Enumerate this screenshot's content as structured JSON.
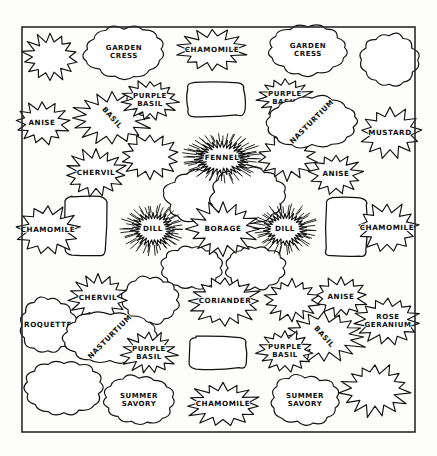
{
  "document": {
    "title": "Herb Garden Plan",
    "kind": "hand-drawn garden planting plan",
    "border": {
      "x": 22,
      "y": 27,
      "width": 393,
      "height": 405,
      "color": "#2a2a2a"
    }
  },
  "palette": {
    "ink": "#111111",
    "paper": "#fdfdfc",
    "label_text": "#0d0d0d"
  },
  "plants": [
    {
      "id": "p01",
      "label": "GARDEN CRESS",
      "lines": [
        "GARDEN",
        "CRESS"
      ],
      "x": 124,
      "y": 52,
      "rx": 38,
      "ry": 24,
      "shape": "cloud",
      "points": 13,
      "rotate": 0
    },
    {
      "id": "p02",
      "label": "CHAMOMILE",
      "lines": [
        "CHAMOMILE"
      ],
      "x": 212,
      "y": 50,
      "rx": 34,
      "ry": 21,
      "shape": "star",
      "points": 14,
      "rotate": 0
    },
    {
      "id": "p03",
      "label": "GARDEN CRESS",
      "lines": [
        "GARDEN",
        "CRESS"
      ],
      "x": 308,
      "y": 50,
      "rx": 38,
      "ry": 23,
      "shape": "cloud",
      "points": 13,
      "rotate": 0
    },
    {
      "id": "p04",
      "label": "BASIL",
      "lines": [
        "BASIL"
      ],
      "x": 112,
      "y": 118,
      "rx": 40,
      "ry": 26,
      "shape": "star",
      "points": 16,
      "rotate": 48
    },
    {
      "id": "p05",
      "label": "PURPLE BASIL",
      "lines": [
        "PURPLE",
        "BASIL"
      ],
      "x": 150,
      "y": 100,
      "rx": 28,
      "ry": 20,
      "shape": "star",
      "points": 15,
      "rotate": 0
    },
    {
      "id": "p06",
      "label": "PURPLE BASIL",
      "lines": [
        "PURPLE",
        "BASIL"
      ],
      "x": 285,
      "y": 98,
      "rx": 28,
      "ry": 20,
      "shape": "star",
      "points": 15,
      "rotate": 0
    },
    {
      "id": "p07",
      "label": "NASTURTIUM",
      "lines": [
        "NASTURTIUM"
      ],
      "x": 312,
      "y": 122,
      "rx": 44,
      "ry": 24,
      "shape": "cloud",
      "points": 14,
      "rotate": -45
    },
    {
      "id": "p08",
      "label": "ANISE",
      "lines": [
        "ANISE"
      ],
      "x": 42,
      "y": 123,
      "rx": 27,
      "ry": 21,
      "shape": "star",
      "points": 13,
      "rotate": 0
    },
    {
      "id": "p09",
      "label": "MUSTARD",
      "lines": [
        "MUSTARD"
      ],
      "x": 390,
      "y": 133,
      "rx": 31,
      "ry": 25,
      "shape": "star",
      "points": 13,
      "rotate": 0
    },
    {
      "id": "p10",
      "label": "FENNEL",
      "lines": [
        "FENNEL"
      ],
      "x": 222,
      "y": 158,
      "rx": 27,
      "ry": 17,
      "shape": "sunburst",
      "points": 34,
      "rotate": 0
    },
    {
      "id": "p11",
      "label": "CHERVIL",
      "lines": [
        "CHERVIL"
      ],
      "x": 96,
      "y": 173,
      "rx": 31,
      "ry": 24,
      "shape": "star",
      "points": 15,
      "rotate": 0
    },
    {
      "id": "p12",
      "label": "ANISE",
      "lines": [
        "ANISE"
      ],
      "x": 336,
      "y": 174,
      "rx": 26,
      "ry": 20,
      "shape": "star",
      "points": 13,
      "rotate": 0
    },
    {
      "id": "p13",
      "label": "CHAMOMILE",
      "lines": [
        "CHAMOMILE"
      ],
      "x": 48,
      "y": 230,
      "rx": 31,
      "ry": 25,
      "shape": "star",
      "points": 13,
      "rotate": 0
    },
    {
      "id": "p14",
      "label": "DILL",
      "lines": [
        "DILL"
      ],
      "x": 153,
      "y": 229,
      "rx": 21,
      "ry": 17,
      "shape": "sunburst",
      "points": 30,
      "rotate": 0
    },
    {
      "id": "p15",
      "label": "BORAGE",
      "lines": [
        "BORAGE"
      ],
      "x": 223,
      "y": 229,
      "rx": 35,
      "ry": 27,
      "shape": "star",
      "points": 16,
      "rotate": 0
    },
    {
      "id": "p16",
      "label": "DILL",
      "lines": [
        "DILL"
      ],
      "x": 285,
      "y": 229,
      "rx": 21,
      "ry": 17,
      "shape": "sunburst",
      "points": 30,
      "rotate": 0
    },
    {
      "id": "p17",
      "label": "CHAMOMILE",
      "lines": [
        "CHAMOMILE"
      ],
      "x": 387,
      "y": 228,
      "rx": 30,
      "ry": 25,
      "shape": "star",
      "points": 13,
      "rotate": 0
    },
    {
      "id": "p18",
      "label": "CHERVIL",
      "lines": [
        "CHERVIL"
      ],
      "x": 98,
      "y": 298,
      "rx": 30,
      "ry": 24,
      "shape": "star",
      "points": 15,
      "rotate": 0
    },
    {
      "id": "p19",
      "label": "CORIANDER",
      "lines": [
        "CORIANDER"
      ],
      "x": 225,
      "y": 301,
      "rx": 36,
      "ry": 25,
      "shape": "star",
      "points": 16,
      "rotate": 0
    },
    {
      "id": "p20",
      "label": "ANISE",
      "lines": [
        "ANISE"
      ],
      "x": 341,
      "y": 297,
      "rx": 26,
      "ry": 20,
      "shape": "star",
      "points": 13,
      "rotate": 0
    },
    {
      "id": "p21",
      "label": "ROQUETTE",
      "lines": [
        "ROQUETTE"
      ],
      "x": 48,
      "y": 325,
      "rx": 27,
      "ry": 26,
      "shape": "cloud",
      "points": 12,
      "rotate": 0
    },
    {
      "id": "p22",
      "label": "ROSE GERANIUM",
      "lines": [
        "ROSE",
        "GERANIUM"
      ],
      "x": 388,
      "y": 321,
      "rx": 33,
      "ry": 24,
      "shape": "star",
      "points": 15,
      "rotate": 0
    },
    {
      "id": "p23",
      "label": "NASTURTIUM",
      "lines": [
        "NASTURTIUM"
      ],
      "x": 110,
      "y": 337,
      "rx": 44,
      "ry": 24,
      "shape": "cloud",
      "points": 14,
      "rotate": -45
    },
    {
      "id": "p24",
      "label": "BASIL",
      "lines": [
        "BASIL"
      ],
      "x": 324,
      "y": 337,
      "rx": 42,
      "ry": 25,
      "shape": "star",
      "points": 16,
      "rotate": 48
    },
    {
      "id": "p25",
      "label": "PURPLE BASIL",
      "lines": [
        "PURPLE",
        "BASIL"
      ],
      "x": 149,
      "y": 353,
      "rx": 28,
      "ry": 21,
      "shape": "star",
      "points": 15,
      "rotate": 0
    },
    {
      "id": "p26",
      "label": "PURPLE BASIL",
      "lines": [
        "PURPLE",
        "BASIL"
      ],
      "x": 285,
      "y": 351,
      "rx": 28,
      "ry": 21,
      "shape": "star",
      "points": 15,
      "rotate": 0
    },
    {
      "id": "p27",
      "label": "SUMMER SAVORY",
      "lines": [
        "SUMMER",
        "SAVORY"
      ],
      "x": 139,
      "y": 400,
      "rx": 33,
      "ry": 23,
      "shape": "cloud",
      "points": 13,
      "rotate": 0
    },
    {
      "id": "p28",
      "label": "CHAMOMILE",
      "lines": [
        "CHAMOMILE"
      ],
      "x": 223,
      "y": 404,
      "rx": 37,
      "ry": 22,
      "shape": "star",
      "points": 15,
      "rotate": 0
    },
    {
      "id": "p29",
      "label": "SUMMER SAVORY",
      "lines": [
        "SUMMER",
        "SAVORY"
      ],
      "x": 305,
      "y": 400,
      "rx": 33,
      "ry": 23,
      "shape": "cloud",
      "points": 13,
      "rotate": 0
    }
  ],
  "unlabeled_plants": [
    {
      "id": "u01",
      "x": 50,
      "y": 57,
      "rx": 28,
      "ry": 24,
      "shape": "star",
      "points": 14,
      "rotate": 0
    },
    {
      "id": "u02",
      "x": 389,
      "y": 60,
      "rx": 28,
      "ry": 25,
      "shape": "cloud",
      "points": 12,
      "rotate": 0
    },
    {
      "id": "u03",
      "x": 204,
      "y": 196,
      "rx": 38,
      "ry": 26,
      "shape": "cloud",
      "points": 13,
      "rotate": 0
    },
    {
      "id": "u04",
      "x": 248,
      "y": 195,
      "rx": 36,
      "ry": 26,
      "shape": "cloud",
      "points": 13,
      "rotate": 0
    },
    {
      "id": "u05",
      "x": 192,
      "y": 268,
      "rx": 28,
      "ry": 20,
      "shape": "cloud",
      "points": 12,
      "rotate": 0
    },
    {
      "id": "u06",
      "x": 255,
      "y": 268,
      "rx": 28,
      "ry": 20,
      "shape": "cloud",
      "points": 12,
      "rotate": 0
    },
    {
      "id": "u07",
      "x": 150,
      "y": 157,
      "rx": 30,
      "ry": 23,
      "shape": "star",
      "points": 14,
      "rotate": 0
    },
    {
      "id": "u08",
      "x": 287,
      "y": 157,
      "rx": 30,
      "ry": 23,
      "shape": "star",
      "points": 14,
      "rotate": 0
    },
    {
      "id": "u09",
      "x": 150,
      "y": 300,
      "rx": 27,
      "ry": 21,
      "shape": "cloud",
      "points": 12,
      "rotate": 0
    },
    {
      "id": "u10",
      "x": 292,
      "y": 300,
      "rx": 27,
      "ry": 21,
      "shape": "star",
      "points": 14,
      "rotate": 0
    },
    {
      "id": "u11",
      "x": 64,
      "y": 388,
      "rx": 36,
      "ry": 26,
      "shape": "cloud",
      "points": 14,
      "rotate": -40
    },
    {
      "id": "u12",
      "x": 375,
      "y": 390,
      "rx": 34,
      "ry": 26,
      "shape": "star",
      "points": 15,
      "rotate": 40
    }
  ],
  "beds": [
    {
      "id": "b01",
      "label": "",
      "x": 188,
      "y": 82,
      "width": 56,
      "height": 34
    },
    {
      "id": "b02",
      "label": "",
      "x": 66,
      "y": 197,
      "width": 40,
      "height": 58
    },
    {
      "id": "b03",
      "label": "",
      "x": 326,
      "y": 198,
      "width": 40,
      "height": 58
    },
    {
      "id": "b04",
      "label": "",
      "x": 190,
      "y": 337,
      "width": 56,
      "height": 31
    }
  ]
}
